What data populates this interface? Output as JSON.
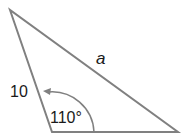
{
  "diagram": {
    "type": "triangle",
    "vertices": {
      "top": [
        10,
        10
      ],
      "bottom_left": [
        52,
        132
      ],
      "bottom_right": [
        178,
        132
      ]
    },
    "labels": {
      "opposite_side": "a",
      "adjacent_side": "10",
      "included_angle": "110°"
    },
    "colors": {
      "stroke": "#808080",
      "text": "#1a1a1a"
    }
  }
}
